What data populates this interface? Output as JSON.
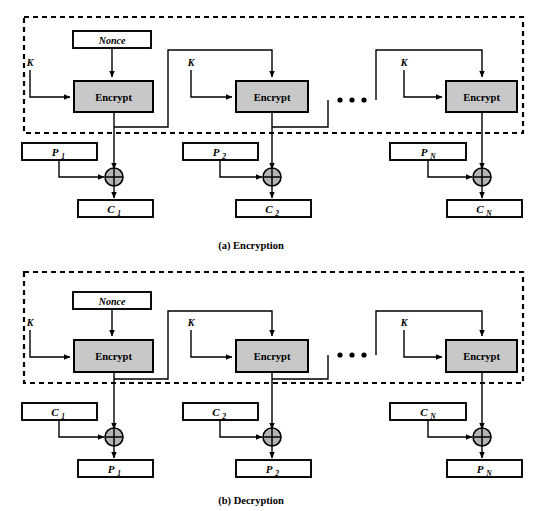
{
  "figure": {
    "type": "block-diagram",
    "panels": [
      {
        "id": "encryption",
        "caption": "(a) Encryption",
        "dashed_group_label": "",
        "nonce_label": "Nonce",
        "key_labels": [
          "K",
          "K",
          "K"
        ],
        "cipher_labels": [
          "Encrypt",
          "Encrypt",
          "Encrypt"
        ],
        "input_labels": [
          "P",
          "P",
          "P"
        ],
        "input_subscripts": [
          "1",
          "2",
          "N"
        ],
        "output_labels": [
          "C",
          "C",
          "C"
        ],
        "output_subscripts": [
          "1",
          "2",
          "N"
        ],
        "xor_symbol": "+",
        "ellipsis_dots": 3
      },
      {
        "id": "decryption",
        "caption": "(b) Decryption",
        "dashed_group_label": "",
        "nonce_label": "Nonce",
        "key_labels": [
          "K",
          "K",
          "K"
        ],
        "cipher_labels": [
          "Encrypt",
          "Encrypt",
          "Encrypt"
        ],
        "input_labels": [
          "C",
          "C",
          "C"
        ],
        "input_subscripts": [
          "1",
          "2",
          "N"
        ],
        "output_labels": [
          "P",
          "P",
          "P"
        ],
        "output_subscripts": [
          "1",
          "2",
          "N"
        ],
        "xor_symbol": "+",
        "ellipsis_dots": 3
      }
    ],
    "colors": {
      "cipher_fill": "#c8c8c8",
      "box_fill": "#ffffff",
      "stroke": "#000000",
      "xor_fill": "#b4b4b4",
      "background": "#ffffff"
    }
  }
}
